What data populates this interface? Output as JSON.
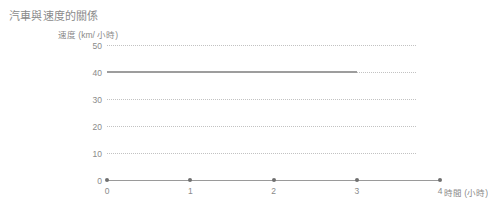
{
  "chart_data": {
    "type": "line",
    "title": "汽車與速度的關係",
    "xlabel": "時間 (小時)",
    "ylabel": "速度 (km/ 小時)",
    "x": [
      0,
      1,
      2,
      3
    ],
    "values": [
      40,
      40,
      40,
      40
    ],
    "series": [
      {
        "name": "速度",
        "x": [
          0,
          1,
          2,
          3
        ],
        "values": [
          40,
          40,
          40,
          40
        ],
        "color": "#9d9d9d"
      }
    ],
    "xticks": [
      "0",
      "1",
      "2",
      "3",
      "4"
    ],
    "xtick_values": [
      0,
      1,
      2,
      3,
      4
    ],
    "yticks": [
      "0",
      "10",
      "20",
      "30",
      "40",
      "50"
    ],
    "ytick_values": [
      0,
      10,
      20,
      30,
      40,
      50
    ],
    "xlim": [
      0,
      4
    ],
    "ylim": [
      0,
      50
    ],
    "grid": true,
    "grid_style": "dotted",
    "grid_color": "#c2c2c2",
    "legend": false,
    "axis_color": "#9a9a9a",
    "text_color": "#8a8a8a",
    "background": "#ffffff"
  }
}
